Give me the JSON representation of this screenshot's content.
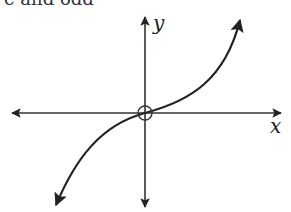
{
  "caption": {
    "clipped_text": "e and odd"
  },
  "graph": {
    "x_label": "x",
    "y_label": "y",
    "curve": "cubic through origin (odd function)",
    "origin_marker": "open circle at origin"
  },
  "colors": {
    "stroke": "#222222",
    "background": "#ffffff"
  }
}
